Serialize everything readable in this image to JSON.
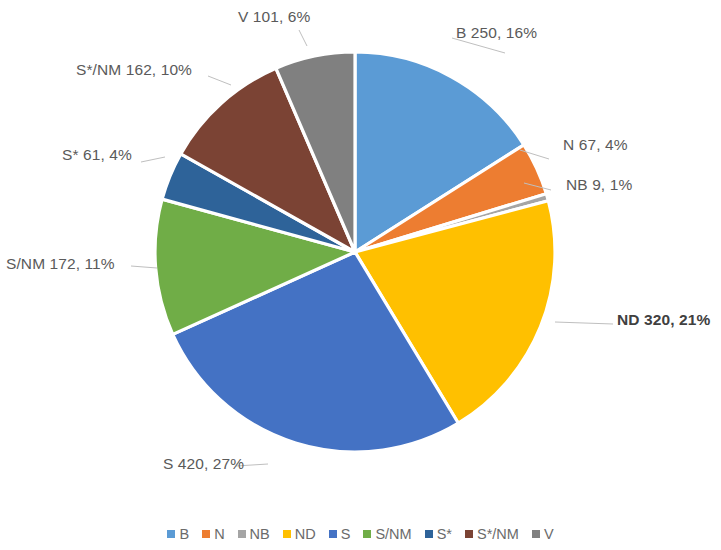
{
  "chart_data": {
    "type": "pie",
    "title": "",
    "legend_position": "bottom",
    "total": 1562,
    "categories": [
      "B",
      "N",
      "NB",
      "ND",
      "S",
      "S/NM",
      "S*",
      "S*/NM",
      "V"
    ],
    "values": [
      250,
      67,
      9,
      320,
      420,
      172,
      61,
      162,
      101
    ],
    "percents": [
      16,
      4,
      1,
      21,
      27,
      11,
      4,
      10,
      6
    ],
    "colors": [
      "#5B9BD5",
      "#ED7D31",
      "#A5A5A5",
      "#FFC000",
      "#4472C4",
      "#70AD47",
      "#2E6399",
      "#7B4334",
      "#808080"
    ],
    "labels": [
      "B 250, 16%",
      "N 67, 4%",
      "NB 9, 1%",
      "ND 320, 21%",
      "S 420, 27%",
      "S/NM 172, 11%",
      "S* 61, 4%",
      "S*/NM 162, 10%",
      "V 101, 6%"
    ],
    "emphasized_label": "ND 320, 21%",
    "slice_order": "clockwise from 12 o'clock"
  },
  "legend": {
    "items": [
      {
        "label": "B",
        "color": "#5B9BD5"
      },
      {
        "label": "N",
        "color": "#ED7D31"
      },
      {
        "label": "NB",
        "color": "#A5A5A5"
      },
      {
        "label": "ND",
        "color": "#FFC000"
      },
      {
        "label": "S",
        "color": "#4472C4"
      },
      {
        "label": "S/NM",
        "color": "#70AD47"
      },
      {
        "label": "S*",
        "color": "#2E6399"
      },
      {
        "label": "S*/NM",
        "color": "#7B4334"
      },
      {
        "label": "V",
        "color": "#808080"
      }
    ]
  },
  "labels": {
    "b": "B 250, 16%",
    "n": "N 67, 4%",
    "nb": "NB 9, 1%",
    "nd": "ND 320, 21%",
    "s": "S 420, 27%",
    "snm": "S/NM 172, 11%",
    "sstar": "S* 61, 4%",
    "sstarnm": "S*/NM 162, 10%",
    "v": "V 101, 6%"
  }
}
